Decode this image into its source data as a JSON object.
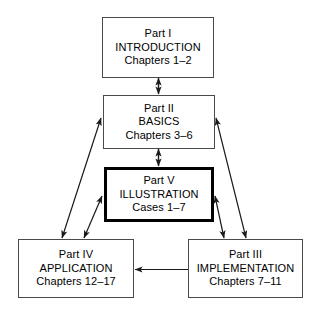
{
  "diagram": {
    "background_color": "#ffffff",
    "line_color": "#1a1a1a",
    "box_border_color": "#4a4a4a",
    "emphasis_border_color": "#000000",
    "nodes": [
      {
        "id": "part-i",
        "part": "Part I",
        "name": "INTRODUCTION",
        "range": "Chapters 1–2",
        "emphasis": false
      },
      {
        "id": "part-ii",
        "part": "Part II",
        "name": "BASICS",
        "range": "Chapters 3–6",
        "emphasis": false
      },
      {
        "id": "part-v",
        "part": "Part V",
        "name": "ILLUSTRATION",
        "range": "Cases 1–7",
        "emphasis": true
      },
      {
        "id": "part-iv",
        "part": "Part IV",
        "name": "APPLICATION",
        "range": "Chapters 12–17",
        "emphasis": false
      },
      {
        "id": "part-iii",
        "part": "Part III",
        "name": "IMPLEMENTATION",
        "range": "Chapters 7–11",
        "emphasis": false
      }
    ],
    "connections": [
      {
        "from": "part-i",
        "to": "part-ii",
        "style": "double-arrow"
      },
      {
        "from": "part-ii",
        "to": "part-v",
        "style": "double-arrow"
      },
      {
        "from": "part-ii",
        "to": "part-iv",
        "style": "double-arrow"
      },
      {
        "from": "part-ii",
        "to": "part-iii",
        "style": "double-arrow"
      },
      {
        "from": "part-v",
        "to": "part-iv",
        "style": "double-arrow"
      },
      {
        "from": "part-v",
        "to": "part-iii",
        "style": "double-arrow"
      },
      {
        "from": "part-iii",
        "to": "part-iv",
        "style": "single-arrow"
      }
    ]
  }
}
